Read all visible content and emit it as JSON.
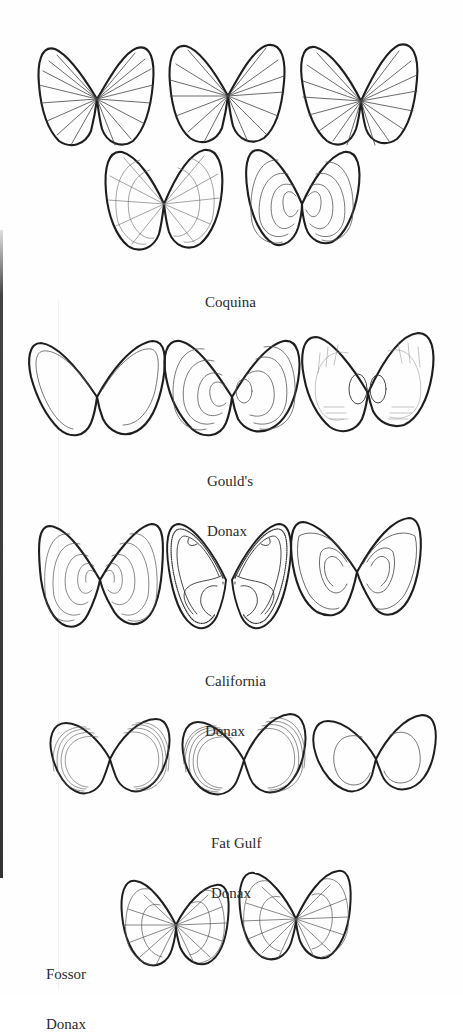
{
  "figure": {
    "species": [
      {
        "id": "coquina",
        "label_lines": [
          "Coquina"
        ],
        "specimen_count": 5
      },
      {
        "id": "goulds-donax",
        "label_lines": [
          "Gould's",
          "Donax"
        ],
        "specimen_count": 3
      },
      {
        "id": "california-donax",
        "label_lines": [
          "California",
          "Donax"
        ],
        "specimen_count": 3
      },
      {
        "id": "fat-gulf-donax",
        "label_lines": [
          "Fat Gulf",
          "Donax"
        ],
        "specimen_count": 3
      },
      {
        "id": "fossor-donax",
        "label_lines": [
          "Fossor",
          "Donax"
        ],
        "specimen_count": 2
      }
    ]
  },
  "colors": {
    "background": "#fefefe",
    "ink": "#1e1e1e",
    "ink_light": "#6a6a6a",
    "text": "#2b2b2b"
  }
}
